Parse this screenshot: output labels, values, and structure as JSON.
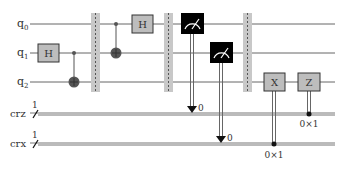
{
  "circuit": {
    "qubits": [
      {
        "name": "q",
        "sub": "0"
      },
      {
        "name": "q",
        "sub": "1"
      },
      {
        "name": "q",
        "sub": "2"
      }
    ],
    "clbits": [
      {
        "name": "crz",
        "width": "1"
      },
      {
        "name": "crx",
        "width": "1"
      }
    ],
    "gates": {
      "h1": "H",
      "h2": "H",
      "x": "X",
      "z": "Z"
    },
    "measure_results": [
      "0",
      "0"
    ],
    "conditions": {
      "x": "0×1",
      "z": "0×1"
    },
    "colors": {
      "gate_fill": "#bdbdbd",
      "gate_border": "#333333",
      "barrier": "#c8c8c8",
      "measure_fill": "#000000",
      "wire": "#666666"
    }
  }
}
